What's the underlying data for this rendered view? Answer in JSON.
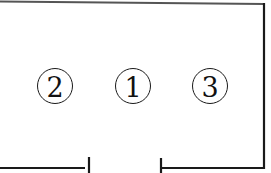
{
  "diagram": {
    "type": "circuit-outline",
    "stroke_color": "#1a1a1a",
    "background": "#ffffff",
    "labels": [
      {
        "id": "label-2",
        "text": "2",
        "cx": 55,
        "cy": 86
      },
      {
        "id": "label-1",
        "text": "1",
        "cx": 133,
        "cy": 86
      },
      {
        "id": "label-3",
        "text": "3",
        "cx": 210,
        "cy": 86
      }
    ],
    "wires": {
      "top": {
        "x1": 0,
        "y1": 1.5,
        "x2": 264,
        "y2": 4
      },
      "right": {
        "x1": 264,
        "y1": 4,
        "x2": 264,
        "y2": 168
      },
      "bottom_right": {
        "x1": 161,
        "y1": 168,
        "x2": 264,
        "y2": 168
      },
      "bottom_left": {
        "x1": 0,
        "y1": 168,
        "x2": 85,
        "y2": 168
      }
    },
    "terminals": [
      {
        "id": "terminal-left",
        "x": 89,
        "y1": 157,
        "y2": 173
      },
      {
        "id": "terminal-right",
        "x": 161,
        "y1": 158,
        "y2": 173
      }
    ]
  }
}
